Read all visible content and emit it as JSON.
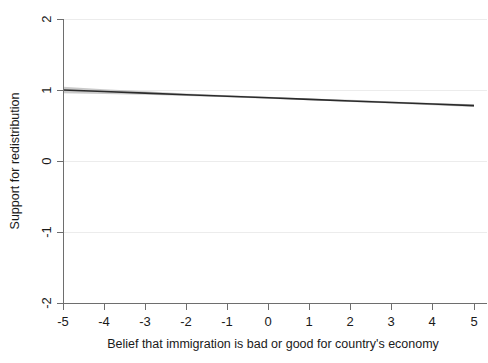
{
  "chart_data": {
    "type": "line",
    "title": "",
    "subtitle": "",
    "xlabel": "Belief that immigration is bad or good for country's economy",
    "ylabel": "Support for redistribution",
    "xlim": [
      -5,
      5
    ],
    "ylim": [
      -2,
      2
    ],
    "xticks": [
      -5,
      -4,
      -3,
      -2,
      -1,
      0,
      1,
      2,
      3,
      4,
      5
    ],
    "xticklabels": [
      "-5",
      "-4",
      "-3",
      "-2",
      "-1",
      "0",
      "1",
      "2",
      "3",
      "4",
      "5"
    ],
    "yticks": [
      -2,
      -1,
      0,
      1,
      2
    ],
    "yticklabels": [
      "-2",
      "-1",
      "0",
      "1",
      "2"
    ],
    "grid": "horizontal",
    "legend": "none",
    "annotations": [],
    "series": [
      {
        "name": "Predicted support for redistribution",
        "kind": "fit-line",
        "x": [
          -5,
          -4,
          -3,
          -2,
          -1,
          0,
          1,
          2,
          3,
          4,
          5
        ],
        "values": [
          1.0,
          0.978,
          0.956,
          0.934,
          0.912,
          0.89,
          0.868,
          0.846,
          0.824,
          0.802,
          0.78
        ]
      },
      {
        "name": "95% confidence interval",
        "kind": "band",
        "x": [
          -5,
          -4,
          -3,
          -2,
          -1,
          0,
          1,
          2,
          3,
          4,
          5
        ],
        "lower": [
          0.955,
          0.945,
          0.932,
          0.917,
          0.898,
          0.876,
          0.854,
          0.832,
          0.809,
          0.786,
          0.762
        ],
        "upper": [
          1.045,
          1.012,
          0.981,
          0.951,
          0.926,
          0.904,
          0.882,
          0.861,
          0.839,
          0.818,
          0.798
        ]
      }
    ],
    "colors": {
      "fit_line": "#2b2b2b",
      "ci_band": "#b4b4b4",
      "axis": "#6e6e6e",
      "gridline": "#ececec",
      "background": "#ffffff",
      "text": "#1a1a1a"
    }
  }
}
